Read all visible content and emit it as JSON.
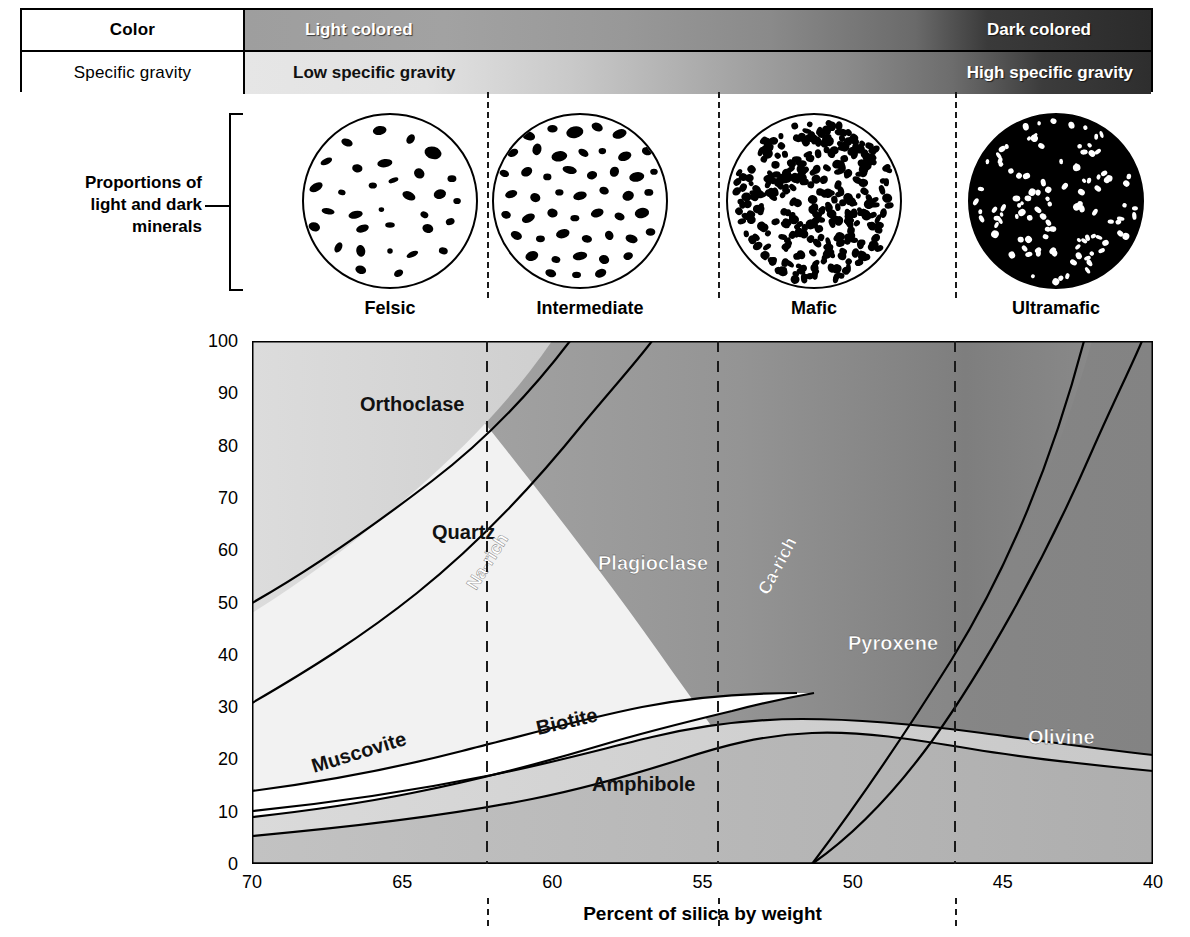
{
  "header": {
    "rows": [
      {
        "label": "Color",
        "bold": true,
        "left_text": "Light colored",
        "right_text": "Dark colored"
      },
      {
        "label": "Specific gravity",
        "bold": false,
        "left_text": "Low specific gravity",
        "right_text": "High specific gravity"
      }
    ]
  },
  "proportions": {
    "label_line1": "Proportions of",
    "label_line2": "light and dark",
    "label_line3": "minerals"
  },
  "rock_types": [
    {
      "name": "Felsic",
      "circle": "light-speckled-circle"
    },
    {
      "name": "Intermediate",
      "circle": "medium-speckled-circle"
    },
    {
      "name": "Mafic",
      "circle": "dense-speckled-circle"
    },
    {
      "name": "Ultramafic",
      "circle": "dark-circle-white-specks"
    }
  ],
  "chart_data": {
    "type": "area",
    "title": "",
    "xlabel": "Percent of silica by weight",
    "ylabel": "Volume percent of minerals",
    "xlim": [
      70,
      40
    ],
    "ylim": [
      0,
      100
    ],
    "xticks": [
      70,
      65,
      60,
      55,
      50,
      45,
      40
    ],
    "yticks": [
      0,
      10,
      20,
      30,
      40,
      50,
      60,
      70,
      80,
      90,
      100
    ],
    "grid": false,
    "legend": "in-place region labels",
    "x_axis_reversed": true,
    "dividers": [
      {
        "label": "Felsic | Intermediate",
        "silica": 62.0
      },
      {
        "label": "Intermediate | Mafic",
        "silica": 54.6
      },
      {
        "label": "Mafic | Ultramafic",
        "silica": 46.5
      }
    ],
    "regions": [
      {
        "name": "Orthoclase",
        "fill": "#d9d9d9",
        "label_x": 66.8,
        "label_y": 88
      },
      {
        "name": "Quartz",
        "fill": "#f4f4f4",
        "label_x": 64.5,
        "label_y": 64
      },
      {
        "name": "Plagioclase",
        "fill": "#9a9a9a",
        "label_x": 58.6,
        "label_y": 58
      },
      {
        "name": "Na-rich",
        "fill": "",
        "label_x": 62.6,
        "label_y": 52,
        "rotated": true
      },
      {
        "name": "Ca-rich",
        "fill": "",
        "label_x": 52.9,
        "label_y": 56,
        "rotated": true
      },
      {
        "name": "Pyroxene",
        "fill": "#8c8c8c",
        "label_x": 50.2,
        "label_y": 40
      },
      {
        "name": "Olivine",
        "fill": "#8c8c8c",
        "label_x": 43.8,
        "label_y": 24
      },
      {
        "name": "Muscovite",
        "fill": "#ffffff",
        "label_x": 66.1,
        "label_y": 19
      },
      {
        "name": "Biotite",
        "fill": "#d0d0d0",
        "label_x": 60.9,
        "label_y": 22
      },
      {
        "name": "Amphibole",
        "fill": "#a6a6a6",
        "label_x": 57.6,
        "label_y": 12
      }
    ],
    "series": [
      {
        "name": "Orthoclase top boundary (cumulative %)",
        "x": [
          70,
          65,
          62,
          60,
          57,
          55
        ],
        "values": [
          100,
          100,
          100,
          100,
          100,
          100
        ]
      },
      {
        "name": "Orthoclase / Quartz boundary",
        "x": [
          70,
          67,
          65,
          62,
          60,
          58,
          56
        ],
        "values": [
          50,
          62,
          72,
          86,
          93,
          98,
          100
        ]
      },
      {
        "name": "Quartz / Plagioclase boundary",
        "x": [
          70,
          67,
          65,
          62,
          60,
          58,
          56,
          55
        ],
        "values": [
          31,
          41,
          48,
          60,
          72,
          86,
          96,
          100
        ]
      },
      {
        "name": "Muscovite band top",
        "x": [
          70,
          67,
          65,
          62,
          60,
          58,
          56
        ],
        "values": [
          14,
          19,
          23,
          30,
          32,
          33,
          32
        ]
      },
      {
        "name": "Muscovite band bottom",
        "x": [
          70,
          67,
          65,
          62,
          60
        ],
        "values": [
          8,
          11,
          14,
          21,
          26
        ]
      },
      {
        "name": "Biotite lower boundary (Amphibole top)",
        "x": [
          70,
          67,
          65,
          62,
          60,
          57,
          55,
          53
        ],
        "values": [
          5,
          6,
          8,
          14,
          19,
          24,
          25,
          20
        ]
      },
      {
        "name": "Amphibole lower limit",
        "x": [
          70,
          65,
          60,
          55,
          52,
          51.5
        ],
        "values": [
          0,
          0,
          0,
          0,
          0,
          0
        ]
      },
      {
        "name": "Pyroxene / Olivine boundary",
        "x": [
          51.5,
          50,
          48,
          46.5,
          45,
          43,
          41,
          40
        ],
        "values": [
          0,
          6,
          18,
          32,
          48,
          68,
          88,
          100
        ]
      },
      {
        "name": "Plagioclase / Pyroxene boundary",
        "x": [
          55,
          53,
          51,
          49,
          47,
          45,
          43,
          41,
          40
        ],
        "values": [
          100,
          80,
          62,
          48,
          36,
          27,
          20,
          14,
          11
        ]
      }
    ]
  }
}
